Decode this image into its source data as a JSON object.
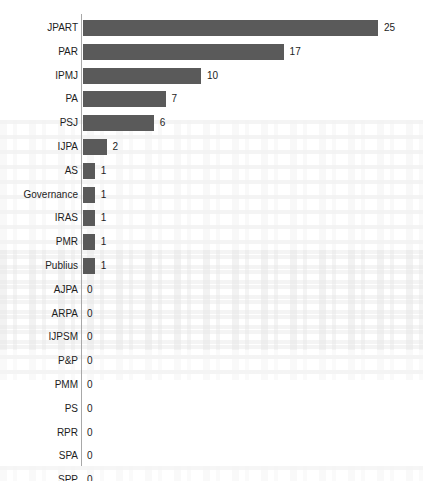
{
  "chart": {
    "type": "bar",
    "orientation": "horizontal",
    "bar_color": "#5a5a5a",
    "axis_color": "#a8a8a8",
    "label_color": "#1d1d1d"
  },
  "chart_data": {
    "type": "bar",
    "title": "",
    "xlabel": "",
    "ylabel": "",
    "orientation": "horizontal",
    "grid": false,
    "legend": false,
    "xlim": [
      0,
      25
    ],
    "categories": [
      "JPART",
      "PAR",
      "IPMJ",
      "PA",
      "PSJ",
      "IJPA",
      "AS",
      "Governance",
      "IRAS",
      "PMR",
      "Publius",
      "AJPA",
      "ARPA",
      "IJPSM",
      "P&P",
      "PMM",
      "PS",
      "RPR",
      "SPA",
      "SPP"
    ],
    "values": [
      25,
      17,
      10,
      7,
      6,
      2,
      1,
      1,
      1,
      1,
      1,
      0,
      0,
      0,
      0,
      0,
      0,
      0,
      0,
      0
    ],
    "value_labels": [
      "25",
      "17",
      "10",
      "7",
      "6",
      "2",
      "1",
      "1",
      "1",
      "1",
      "1",
      "0",
      "0",
      "0",
      "0",
      "0",
      "0",
      "0",
      "0",
      "0"
    ]
  }
}
